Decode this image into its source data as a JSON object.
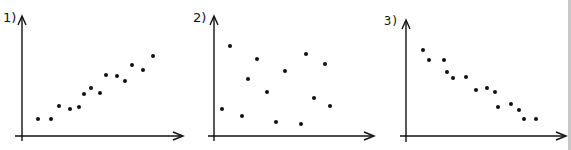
{
  "figure": {
    "colors": {
      "ink": "#111111",
      "border": "#c8c8c8",
      "background": "#ffffff"
    }
  },
  "chart_data": [
    {
      "type": "scatter",
      "title": "1)",
      "xlabel": "",
      "ylabel": "",
      "grid": false,
      "trend": "positive correlation",
      "origin": [
        22,
        136
      ],
      "x_axis": {
        "from": [
          15,
          136
        ],
        "to": [
          183,
          136
        ]
      },
      "y_axis": {
        "from": [
          22,
          141
        ],
        "to": [
          22,
          16
        ]
      },
      "label_pos": [
        3,
        22
      ],
      "points": [
        [
          38,
          119
        ],
        [
          51,
          119
        ],
        [
          59,
          106
        ],
        [
          70,
          109
        ],
        [
          79,
          107
        ],
        [
          84,
          94
        ],
        [
          91,
          88
        ],
        [
          100,
          93
        ],
        [
          106,
          75
        ],
        [
          117,
          76
        ],
        [
          125,
          81
        ],
        [
          132,
          65
        ],
        [
          143,
          70
        ],
        [
          153,
          56
        ]
      ]
    },
    {
      "type": "scatter",
      "title": "2)",
      "xlabel": "",
      "ylabel": "",
      "grid": false,
      "trend": "no correlation",
      "origin": [
        214,
        136
      ],
      "x_axis": {
        "from": [
          208,
          136
        ],
        "to": [
          374,
          136
        ]
      },
      "y_axis": {
        "from": [
          214,
          141
        ],
        "to": [
          214,
          16
        ]
      },
      "label_pos": [
        193,
        22
      ],
      "points": [
        [
          230,
          46
        ],
        [
          257,
          59
        ],
        [
          306,
          54
        ],
        [
          325,
          64
        ],
        [
          285,
          71
        ],
        [
          248,
          79
        ],
        [
          267,
          92
        ],
        [
          314,
          98
        ],
        [
          330,
          106
        ],
        [
          222,
          109
        ],
        [
          242,
          116
        ],
        [
          276,
          122
        ],
        [
          301,
          124
        ]
      ]
    },
    {
      "type": "scatter",
      "title": "3)",
      "xlabel": "",
      "ylabel": "",
      "grid": false,
      "trend": "negative correlation",
      "origin": [
        406,
        136
      ],
      "x_axis": {
        "from": [
          400,
          136
        ],
        "to": [
          566,
          136
        ]
      },
      "y_axis": {
        "from": [
          406,
          142
        ],
        "to": [
          406,
          20
        ]
      },
      "label_pos": [
        384,
        25
      ],
      "mono_label": true,
      "points": [
        [
          423,
          50
        ],
        [
          429,
          60
        ],
        [
          444,
          60
        ],
        [
          447,
          72
        ],
        [
          453,
          78
        ],
        [
          466,
          77
        ],
        [
          476,
          90
        ],
        [
          487,
          88
        ],
        [
          495,
          92
        ],
        [
          498,
          107
        ],
        [
          511,
          104
        ],
        [
          519,
          110
        ],
        [
          524,
          119
        ],
        [
          536,
          119
        ]
      ]
    }
  ]
}
